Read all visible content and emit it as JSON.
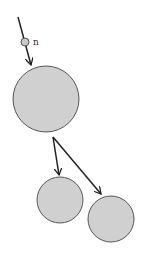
{
  "diagram": {
    "type": "tree",
    "input_node": {
      "label": "n",
      "cx": 25,
      "cy": 42,
      "r": 4
    },
    "root": {
      "cx": 46,
      "cy": 99,
      "r": 33
    },
    "children": [
      {
        "cx": 60,
        "cy": 200,
        "r": 23
      },
      {
        "cx": 111,
        "cy": 219,
        "r": 23
      }
    ],
    "colors": {
      "fill": "#d0d0d0",
      "stroke": "#555555",
      "arrow": "#222222"
    }
  }
}
